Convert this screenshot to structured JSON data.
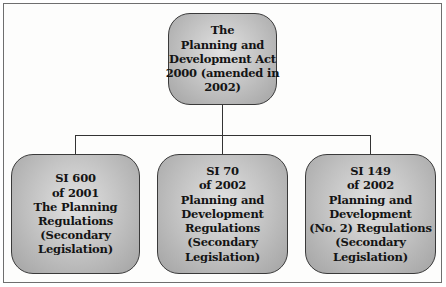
{
  "diagram": {
    "type": "org-chart",
    "root": {
      "id": "act-2000",
      "lines": [
        "The",
        "Planning and",
        "Development Act",
        "2000 (amended in",
        "2002)"
      ]
    },
    "children": [
      {
        "id": "si-600-2001",
        "lines": [
          "SI 600",
          "of 2001",
          "The Planning",
          "Regulations",
          "(Secondary",
          "Legislation)"
        ]
      },
      {
        "id": "si-70-2002",
        "lines": [
          "SI 70",
          "of 2002",
          "Planning and",
          "Development",
          "Regulations",
          "(Secondary",
          "Legislation)"
        ]
      },
      {
        "id": "si-149-2002",
        "lines": [
          "SI 149",
          "of 2002",
          "Planning and",
          "Development",
          "(No. 2) Regulations",
          "(Secondary",
          "Legislation)"
        ]
      }
    ],
    "edges": [
      {
        "from": "act-2000",
        "to": "si-600-2001"
      },
      {
        "from": "act-2000",
        "to": "si-70-2002"
      },
      {
        "from": "act-2000",
        "to": "si-149-2002"
      }
    ],
    "colors": {
      "node_fill_center": "#e2e2e2",
      "node_fill_edge": "#a3a3a3",
      "node_border": "#3a3a3a",
      "connector": "#333333",
      "frame_border": "#6e6e6e"
    }
  }
}
